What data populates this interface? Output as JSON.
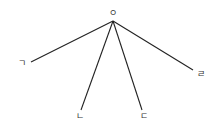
{
  "diagram": {
    "type": "radial-tree",
    "root": {
      "label": "ㅇ",
      "x": 113,
      "y": 21,
      "label_x": 113,
      "label_y": 16
    },
    "leaves": [
      {
        "label": "ㄱ",
        "x": 31,
        "y": 62,
        "label_x": 22,
        "label_y": 66
      },
      {
        "label": "ㄴ",
        "x": 81,
        "y": 110,
        "label_x": 80,
        "label_y": 119
      },
      {
        "label": "ㄷ",
        "x": 142,
        "y": 110,
        "label_x": 144,
        "label_y": 119
      },
      {
        "label": "ㄹ",
        "x": 193,
        "y": 70,
        "label_x": 201,
        "label_y": 77
      }
    ],
    "colors": {
      "background": "#ffffff",
      "line": "#222222",
      "label": "#333333"
    }
  }
}
